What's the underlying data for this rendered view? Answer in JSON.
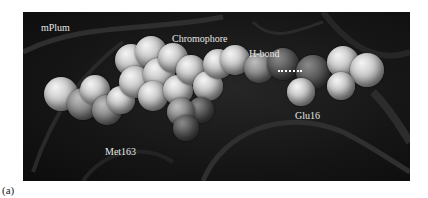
{
  "figure": {
    "panel_label": "(a)",
    "labels": {
      "protein": "mPlum",
      "chromophore": "Chromophore",
      "hbond": "H-bond",
      "residue_glu": "Glu16",
      "residue_met": "Met163"
    },
    "label_positions": {
      "protein": [
        18,
        10
      ],
      "chromophore": [
        149,
        21
      ],
      "hbond": [
        226,
        36
      ],
      "residue_glu": [
        272,
        98
      ],
      "residue_met": [
        82,
        134
      ]
    },
    "hbond_line": {
      "x": 255,
      "y": 58,
      "width": 24
    },
    "colors": {
      "background": "#151515",
      "label": "#e6e6e6",
      "hbond": "#ffffff"
    },
    "spheres": [
      {
        "tone": "light",
        "x": 38,
        "y": 82,
        "r": 17
      },
      {
        "tone": "mid",
        "x": 60,
        "y": 92,
        "r": 16
      },
      {
        "tone": "light",
        "x": 72,
        "y": 78,
        "r": 15
      },
      {
        "tone": "mid",
        "x": 84,
        "y": 98,
        "r": 15
      },
      {
        "tone": "light",
        "x": 98,
        "y": 88,
        "r": 14
      },
      {
        "tone": "light",
        "x": 108,
        "y": 48,
        "r": 16
      },
      {
        "tone": "light",
        "x": 128,
        "y": 40,
        "r": 16
      },
      {
        "tone": "light",
        "x": 112,
        "y": 70,
        "r": 16
      },
      {
        "tone": "light",
        "x": 136,
        "y": 62,
        "r": 16
      },
      {
        "tone": "light",
        "x": 150,
        "y": 46,
        "r": 15
      },
      {
        "tone": "light",
        "x": 130,
        "y": 84,
        "r": 15
      },
      {
        "tone": "light",
        "x": 155,
        "y": 78,
        "r": 15
      },
      {
        "tone": "light",
        "x": 168,
        "y": 58,
        "r": 15
      },
      {
        "tone": "light",
        "x": 185,
        "y": 74,
        "r": 15
      },
      {
        "tone": "light",
        "x": 195,
        "y": 52,
        "r": 15
      },
      {
        "tone": "dark",
        "x": 178,
        "y": 98,
        "r": 13
      },
      {
        "tone": "mid",
        "x": 158,
        "y": 100,
        "r": 14
      },
      {
        "tone": "dark",
        "x": 163,
        "y": 116,
        "r": 13
      },
      {
        "tone": "light",
        "x": 212,
        "y": 48,
        "r": 15
      },
      {
        "tone": "mid",
        "x": 236,
        "y": 56,
        "r": 15
      },
      {
        "tone": "dark",
        "x": 260,
        "y": 52,
        "r": 16
      },
      {
        "tone": "dark",
        "x": 290,
        "y": 60,
        "r": 17
      },
      {
        "tone": "light",
        "x": 278,
        "y": 80,
        "r": 14
      },
      {
        "tone": "light",
        "x": 320,
        "y": 50,
        "r": 16
      },
      {
        "tone": "light",
        "x": 344,
        "y": 58,
        "r": 17
      },
      {
        "tone": "light",
        "x": 318,
        "y": 74,
        "r": 14
      }
    ]
  }
}
